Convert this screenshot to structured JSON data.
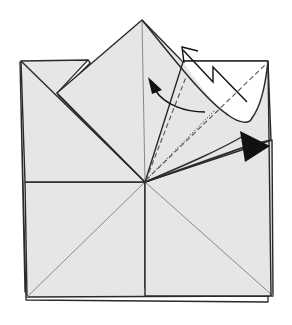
{
  "diagram": {
    "type": "origami-step",
    "colors": {
      "paper": "#e6e6e6",
      "paper_white": "#ffffff",
      "line": "#2a2a2a",
      "crease": "#8a8a8a",
      "arrow": "#111111"
    },
    "symbols": [
      {
        "name": "push-arrow",
        "meaning": "push / squash here"
      },
      {
        "name": "curved-fold-arrow",
        "meaning": "fold flap over to the left"
      },
      {
        "name": "zigzag-arrow",
        "meaning": "pleat / fold behind"
      },
      {
        "name": "valley-fold-lines",
        "meaning": "dashed valley fold creases"
      },
      {
        "name": "mountain-fold-line",
        "meaning": "dot-dash fold line"
      }
    ]
  }
}
